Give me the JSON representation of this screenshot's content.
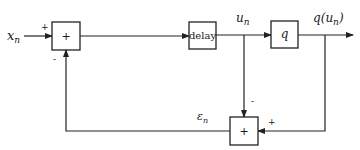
{
  "diagram": {
    "type": "block-diagram",
    "input": {
      "label": "x",
      "subscript": "n"
    },
    "blocks": [
      {
        "id": "sum1",
        "label": "+",
        "inputs": [
          {
            "sign": "+"
          },
          {
            "sign": "-"
          }
        ]
      },
      {
        "id": "delay",
        "label": "delay"
      },
      {
        "id": "quantizer",
        "label": "q"
      },
      {
        "id": "sum2",
        "label": "+",
        "inputs": [
          {
            "sign": "-"
          },
          {
            "sign": "+"
          }
        ]
      }
    ],
    "signals": {
      "u": {
        "label": "u",
        "subscript": "n"
      },
      "q_out": {
        "prefix": "q(",
        "label": "u",
        "subscript": "n",
        "suffix": ")"
      },
      "error": {
        "label": "ε",
        "subscript": "n"
      }
    },
    "signs": {
      "sum1_top": "+",
      "sum1_bottom": "-",
      "sum2_top": "-",
      "sum2_right": "+"
    }
  }
}
